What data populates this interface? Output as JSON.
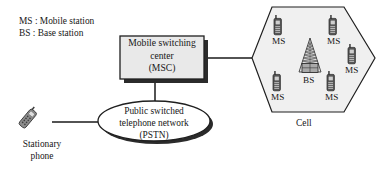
{
  "diagram": {
    "colors": {
      "line": "#1a1a1a",
      "cell_fill": "#f0f0f0",
      "box_fill": "#e9e9e9",
      "shadow": "#2b2b2b",
      "phone_body": "#4a4a4a",
      "phone_screen": "#bdbdbd",
      "text": "#171717"
    },
    "legend": {
      "name": "abbreviation-legend",
      "lines": [
        "MS : Mobile station",
        "BS : Base station"
      ]
    },
    "msc": {
      "name": "mobile-switching-center",
      "lines": [
        "Mobile switching",
        "center",
        "(MSC)"
      ],
      "shape": "rectangle-with-shadow"
    },
    "pstn": {
      "name": "public-switched-telephone-network",
      "lines": [
        "Public switched",
        "telephone network",
        "(PSTN)"
      ],
      "shape": "ellipse-with-shadow"
    },
    "stationary_phone": {
      "name": "stationary-phone",
      "lines": [
        "Stationary",
        "phone"
      ],
      "icon": "tilted-handset-icon"
    },
    "cell": {
      "name": "cell-hexagon",
      "label": "Cell",
      "shape": "hexagon",
      "base_station": {
        "name": "base-station",
        "label": "BS",
        "icon": "antenna-tower-icon"
      },
      "mobile_stations": [
        {
          "label": "MS",
          "icon": "mobile-phone-icon",
          "position": "top-left"
        },
        {
          "label": "MS",
          "icon": "mobile-phone-icon",
          "position": "top-right"
        },
        {
          "label": "MS",
          "icon": "mobile-phone-icon",
          "position": "right"
        },
        {
          "label": "MS",
          "icon": "mobile-phone-icon",
          "position": "bottom-left"
        },
        {
          "label": "MS",
          "icon": "mobile-phone-icon",
          "position": "bottom-right"
        }
      ]
    },
    "links": [
      {
        "name": "link-msc-to-cell",
        "from": "MSC",
        "to": "Cell"
      },
      {
        "name": "link-msc-to-pstn",
        "from": "MSC",
        "to": "PSTN"
      },
      {
        "name": "link-pstn-to-stationary-phone",
        "from": "PSTN",
        "to": "Stationary phone"
      }
    ]
  }
}
